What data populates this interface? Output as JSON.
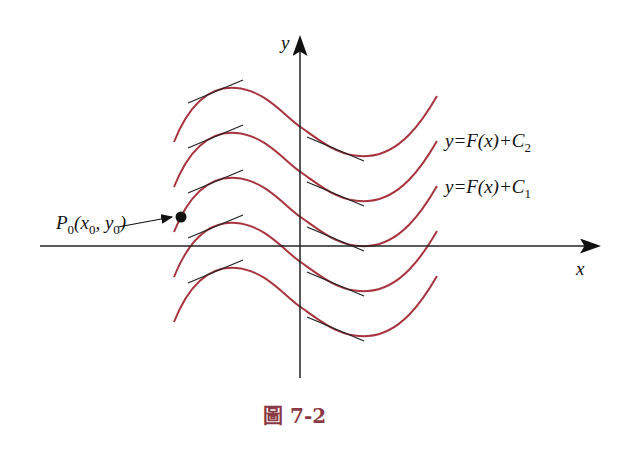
{
  "figure": {
    "caption": "圖 7-2",
    "axes": {
      "x_label": "x",
      "y_label": "y"
    },
    "curve_labels": [
      {
        "text": "y=F(x)+C",
        "sub": "2"
      },
      {
        "text": "y=F(x)+C",
        "sub": "1"
      }
    ],
    "point_label": {
      "text": "P",
      "sub": "0",
      "args": "(x",
      "args_sub1": "0",
      "mid": ", y",
      "args_sub2": "0",
      "end": ")"
    },
    "colors": {
      "curve": "#a8343f",
      "axis": "#222222",
      "tangent": "#222222",
      "caption": "#8a3a44"
    },
    "curve_count": 5
  }
}
